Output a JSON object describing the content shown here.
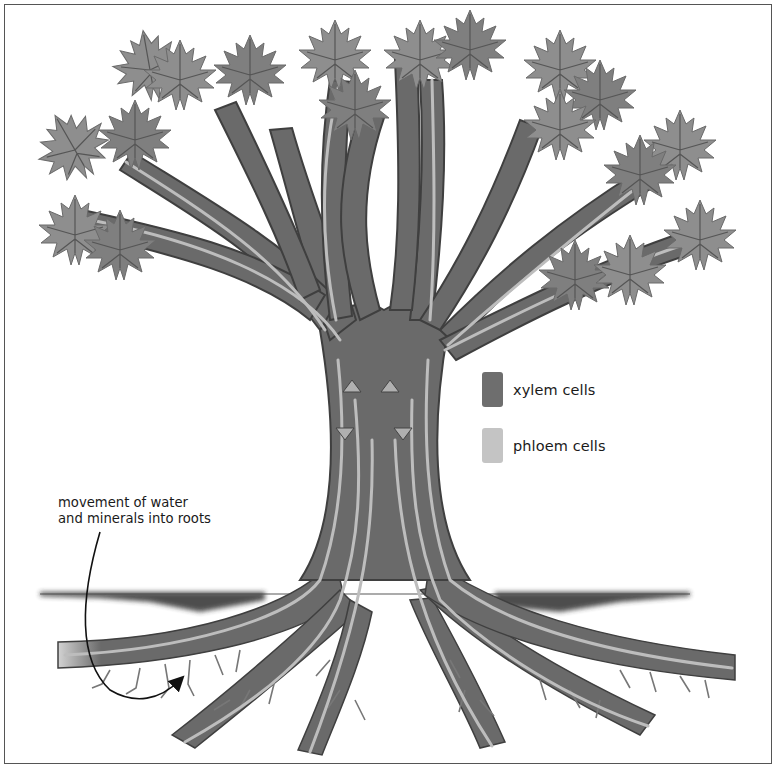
{
  "diagram": {
    "legend": [
      {
        "label": "xylem cells",
        "color": "#6e6e6e"
      },
      {
        "label": "phloem cells",
        "color": "#c4c4c4"
      }
    ],
    "annotation": {
      "line1": "movement of water",
      "line2": "and minerals into roots"
    },
    "colors": {
      "bark": "#6a6a6a",
      "bark_dark": "#3f3f3f",
      "phloem_stripe": "#bdbdbd",
      "leaf": "#8e8e8e",
      "leaf_dark": "#757575",
      "soil": "#2e2e2e",
      "arrow": "#b0b0b0"
    }
  }
}
